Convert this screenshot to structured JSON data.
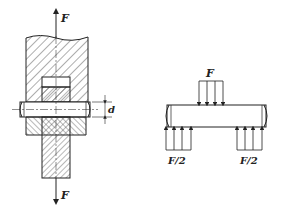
{
  "figure": {
    "left_view": {
      "description": "pin joint assembly cross-section",
      "top_force_label": "F",
      "bottom_force_label": "F",
      "dimension_label": "d"
    },
    "right_view": {
      "description": "free-body diagram of pin",
      "top_load_label": "F",
      "left_reaction_label": "F/2",
      "right_reaction_label": "F/2"
    },
    "colors": {
      "line": "#222222",
      "background": "#ffffff"
    }
  }
}
